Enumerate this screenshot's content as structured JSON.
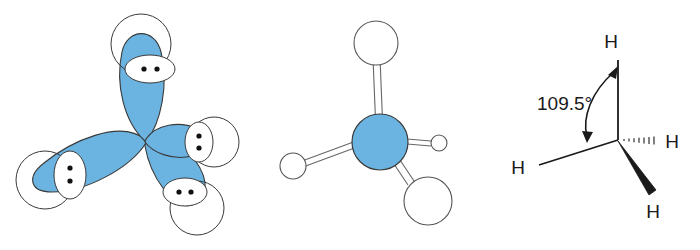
{
  "figure": {
    "background_color": "#ffffff",
    "outline_color": "#3a3a3a",
    "orbital_fill_color": "#6bb3e0",
    "atom_fill_color": "#ffffff",
    "text_color": "#1a1a1a",
    "bond_color": "#555555"
  },
  "panels": [
    {
      "id": "orbital-overlap",
      "name": "sp3-orbital-overlap-diagram",
      "description": "Four sp3 hybrid orbital lobes of carbon overlapping four hydrogen 1s spherical orbitals, each overlap region showing a shared electron pair of two dots",
      "lobe_count": 4,
      "hydrogen_count": 4,
      "electron_pairs": 4,
      "dots_per_pair": 2,
      "lobes": [
        {
          "name": "lobe-up",
          "direction": "up",
          "angle_deg": -90,
          "length": 110,
          "foreshortened": false
        },
        {
          "name": "lobe-left",
          "direction": "left-down",
          "angle_deg": 170,
          "length": 112,
          "foreshortened": false
        },
        {
          "name": "lobe-lower-right",
          "direction": "right-down",
          "angle_deg": 50,
          "length": 100,
          "foreshortened": false
        },
        {
          "name": "lobe-right",
          "direction": "right",
          "angle_deg": 8,
          "length": 52,
          "foreshortened": true
        }
      ]
    },
    {
      "id": "ball-and-stick",
      "name": "ball-and-stick-model",
      "description": "Ball-and-stick model of methane: blue carbon sphere at center bonded to four white hydrogen spheres drawn with perspective sizing",
      "center_atom": "C",
      "center_atom_color": "#6bb3e0",
      "bond_count": 4,
      "hydrogens": [
        {
          "name": "h-top",
          "position": "top",
          "radius": 22,
          "perspective": "front"
        },
        {
          "name": "h-left",
          "position": "left",
          "radius": 13,
          "perspective": "mid"
        },
        {
          "name": "h-right-small",
          "position": "right",
          "radius": 8,
          "perspective": "back"
        },
        {
          "name": "h-bottom",
          "position": "bottom-right",
          "radius": 24,
          "perspective": "front"
        }
      ]
    },
    {
      "id": "wedge-dash",
      "name": "wedge-dash-structure",
      "description": "Wedge-and-dash line structure of methane showing the tetrahedral bond angle",
      "angle_label": "109.5°",
      "atom_labels": [
        "H",
        "H",
        "H",
        "H"
      ],
      "bonds": [
        {
          "name": "bond-up",
          "style": "plain-line",
          "to_label": "H",
          "direction": "up"
        },
        {
          "name": "bond-left",
          "style": "plain-line",
          "to_label": "H",
          "direction": "left-down"
        },
        {
          "name": "bond-right-dash",
          "style": "hashed",
          "to_label": "H",
          "direction": "right"
        },
        {
          "name": "bond-wedge",
          "style": "solid-wedge",
          "to_label": "H",
          "direction": "down-right"
        }
      ],
      "angle_arrow": {
        "name": "angle-arc-arrow",
        "double_headed": true,
        "from_bond": "bond-left",
        "to_bond": "bond-up"
      }
    }
  ],
  "labels": {
    "angle": "109.5°",
    "hydrogen_top": "H",
    "hydrogen_left": "H",
    "hydrogen_right": "H",
    "hydrogen_bottom": "H"
  }
}
